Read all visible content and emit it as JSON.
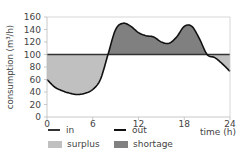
{
  "chart_data": {
    "type": "area",
    "title": "",
    "xlabel": "time (h)",
    "ylabel": "consumption (m³/h)",
    "xlim": [
      0,
      24
    ],
    "ylim": [
      0,
      160
    ],
    "xticks": [
      0,
      6,
      12,
      18,
      24
    ],
    "yticks": [
      0,
      20,
      40,
      60,
      80,
      100,
      120,
      140,
      160
    ],
    "grid": false,
    "legend_position": "bottom",
    "series": [
      {
        "name": "in",
        "color": "#333333",
        "x": [
          0,
          24
        ],
        "values": [
          100,
          100
        ]
      },
      {
        "name": "out",
        "color": "#111111",
        "x": [
          0,
          1,
          2,
          3,
          4,
          5,
          6,
          7,
          8,
          9,
          10,
          11,
          12,
          13,
          14,
          15,
          16,
          17,
          18,
          19,
          20,
          21,
          22,
          23,
          24
        ],
        "values": [
          60,
          48,
          42,
          38,
          36,
          38,
          44,
          60,
          100,
          140,
          150,
          145,
          135,
          130,
          128,
          120,
          118,
          128,
          145,
          145,
          125,
          100,
          95,
          85,
          73
        ]
      }
    ],
    "fills": [
      {
        "name": "surplus",
        "color": "#c0c0c0",
        "description": "in > out"
      },
      {
        "name": "shortage",
        "color": "#808080",
        "description": "out > in"
      }
    ]
  },
  "legend": {
    "in": "in",
    "out": "out",
    "surplus": "surplus",
    "shortage": "shortage"
  },
  "axis": {
    "xlabel": "time (h)",
    "ylabel": "consumption (m³/h)",
    "xticks": [
      "0",
      "6",
      "12",
      "18",
      "24"
    ],
    "yticks": [
      "0",
      "20",
      "40",
      "60",
      "80",
      "100",
      "120",
      "140",
      "160"
    ]
  },
  "colors": {
    "surplus": "#c0c0c0",
    "shortage": "#808080",
    "line": "#111111"
  }
}
